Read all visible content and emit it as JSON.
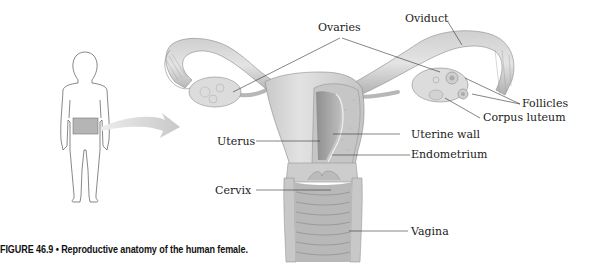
{
  "figure": {
    "caption": "FIGURE 46.9 • Reproductive anatomy of the human female.",
    "labels": {
      "ovaries": "Ovaries",
      "oviduct": "Oviduct",
      "follicles": "Follicles",
      "corpus_luteum": "Corpus luteum",
      "uterus": "Uterus",
      "uterine_wall": "Uterine wall",
      "endometrium": "Endometrium",
      "cervix": "Cervix",
      "vagina": "Vagina"
    },
    "colors": {
      "tissue_light": "#d9d9d9",
      "tissue_mid": "#bdbdbd",
      "tissue_dark": "#9a9a9a",
      "arrow": "#cfcfcf",
      "highlight_box": "#b5b5b5",
      "leader_line": "#333333"
    }
  }
}
